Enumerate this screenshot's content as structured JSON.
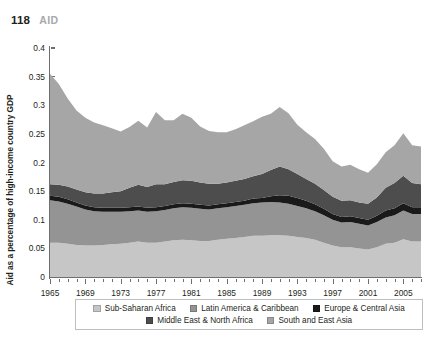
{
  "header": {
    "page_number": "118",
    "section": "AID"
  },
  "chart_data": {
    "type": "area",
    "stacked": true,
    "title": "",
    "xlabel": "",
    "ylabel": "Aid as a percentage of high-income country GDP",
    "xlim": [
      1965,
      2007
    ],
    "ylim": [
      0,
      0.4
    ],
    "ytick_labels": [
      "0",
      "0.05",
      "0.1",
      "0.15",
      "0.2",
      "0.25",
      "0.3",
      "0.35",
      "0.4"
    ],
    "ytick_values": [
      0,
      0.05,
      0.1,
      0.15,
      0.2,
      0.25,
      0.3,
      0.35,
      0.4
    ],
    "xtick_labels": [
      "1965",
      "1969",
      "1973",
      "1977",
      "1981",
      "1985",
      "1989",
      "1993",
      "1997",
      "2001",
      "2005"
    ],
    "xtick_values": [
      1965,
      1969,
      1973,
      1977,
      1981,
      1985,
      1989,
      1993,
      1997,
      2001,
      2005
    ],
    "grid": false,
    "legend_position": "bottom",
    "x": [
      1965,
      1966,
      1967,
      1968,
      1969,
      1970,
      1971,
      1972,
      1973,
      1974,
      1975,
      1976,
      1977,
      1978,
      1979,
      1980,
      1981,
      1982,
      1983,
      1984,
      1985,
      1986,
      1987,
      1988,
      1989,
      1990,
      1991,
      1992,
      1993,
      1994,
      1995,
      1996,
      1997,
      1998,
      1999,
      2000,
      2001,
      2002,
      2003,
      2004,
      2005,
      2006,
      2007
    ],
    "series": [
      {
        "name": "Sub-Saharan Africa",
        "color": "#c6c6c6",
        "values": [
          0.06,
          0.06,
          0.058,
          0.056,
          0.055,
          0.055,
          0.056,
          0.057,
          0.058,
          0.06,
          0.062,
          0.06,
          0.06,
          0.062,
          0.064,
          0.065,
          0.064,
          0.063,
          0.063,
          0.065,
          0.067,
          0.068,
          0.07,
          0.072,
          0.072,
          0.073,
          0.073,
          0.072,
          0.07,
          0.068,
          0.065,
          0.06,
          0.055,
          0.052,
          0.052,
          0.05,
          0.048,
          0.052,
          0.058,
          0.06,
          0.066,
          0.062,
          0.062
        ]
      },
      {
        "name": "Latin America & Caribbean",
        "color": "#949494",
        "values": [
          0.074,
          0.072,
          0.07,
          0.067,
          0.063,
          0.06,
          0.058,
          0.057,
          0.056,
          0.055,
          0.054,
          0.054,
          0.055,
          0.055,
          0.056,
          0.057,
          0.057,
          0.056,
          0.055,
          0.055,
          0.055,
          0.056,
          0.056,
          0.057,
          0.058,
          0.058,
          0.057,
          0.056,
          0.054,
          0.052,
          0.05,
          0.048,
          0.045,
          0.043,
          0.044,
          0.043,
          0.042,
          0.044,
          0.046,
          0.048,
          0.05,
          0.048,
          0.048
        ]
      },
      {
        "name": "Europe & Central Asia",
        "color": "#1a1a1a",
        "values": [
          0.008,
          0.008,
          0.008,
          0.007,
          0.007,
          0.007,
          0.007,
          0.007,
          0.007,
          0.007,
          0.007,
          0.007,
          0.007,
          0.007,
          0.007,
          0.007,
          0.007,
          0.007,
          0.007,
          0.007,
          0.007,
          0.007,
          0.007,
          0.008,
          0.008,
          0.01,
          0.013,
          0.014,
          0.014,
          0.013,
          0.012,
          0.011,
          0.01,
          0.01,
          0.01,
          0.01,
          0.01,
          0.011,
          0.012,
          0.012,
          0.013,
          0.012,
          0.012
        ]
      },
      {
        "name": "Middle East & North Africa",
        "color": "#4d4d4d",
        "values": [
          0.02,
          0.021,
          0.022,
          0.023,
          0.023,
          0.024,
          0.025,
          0.027,
          0.029,
          0.034,
          0.038,
          0.036,
          0.04,
          0.038,
          0.039,
          0.04,
          0.04,
          0.039,
          0.038,
          0.036,
          0.036,
          0.037,
          0.038,
          0.039,
          0.042,
          0.046,
          0.05,
          0.046,
          0.042,
          0.038,
          0.036,
          0.033,
          0.03,
          0.028,
          0.028,
          0.027,
          0.028,
          0.032,
          0.04,
          0.044,
          0.048,
          0.042,
          0.04
        ]
      },
      {
        "name": "South and East Asia",
        "color": "#a6a6a6",
        "values": [
          0.193,
          0.176,
          0.154,
          0.138,
          0.13,
          0.124,
          0.119,
          0.112,
          0.104,
          0.106,
          0.112,
          0.104,
          0.126,
          0.112,
          0.108,
          0.116,
          0.11,
          0.098,
          0.092,
          0.09,
          0.088,
          0.09,
          0.094,
          0.096,
          0.1,
          0.098,
          0.104,
          0.098,
          0.086,
          0.082,
          0.078,
          0.072,
          0.062,
          0.06,
          0.062,
          0.058,
          0.054,
          0.058,
          0.062,
          0.066,
          0.074,
          0.066,
          0.066
        ]
      }
    ],
    "legend": [
      {
        "label": "Sub-Saharan Africa",
        "color": "#c6c6c6"
      },
      {
        "label": "Latin America & Caribbean",
        "color": "#949494"
      },
      {
        "label": "Europe & Central Asia",
        "color": "#1a1a1a"
      },
      {
        "label": "Middle East & North Africa",
        "color": "#4d4d4d"
      },
      {
        "label": "South and East Asia",
        "color": "#a6a6a6"
      }
    ]
  }
}
